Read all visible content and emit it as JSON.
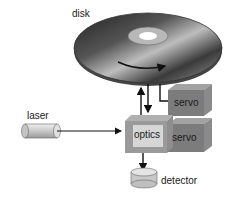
{
  "labels": {
    "disk": "disk",
    "laser": "laser",
    "optics": "optics",
    "servo_top": "servo",
    "servo_bottom": "servo",
    "detector": "detector"
  },
  "colors": {
    "disk_dark": "#1c1c1c",
    "disk_light": "#d8d8d8",
    "servo_front": "#7a7a7a",
    "servo_top": "#9a9a9a",
    "servo_side": "#8a8a8a",
    "optics_frame": "#9a9a9a",
    "optics_face": "#d4d4d4",
    "arrow": "#111111"
  }
}
